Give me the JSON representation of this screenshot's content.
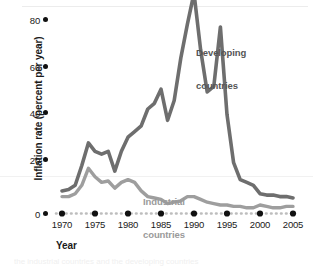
{
  "chart_data": {
    "type": "line",
    "title": "",
    "xlabel": "Year",
    "ylabel": "Inflation rate (percent per year)",
    "xlim": [
      1968,
      2006
    ],
    "ylim": [
      0,
      85
    ],
    "xticks": [
      "1970",
      "1975",
      "1980",
      "1985",
      "1990",
      "1995",
      "2000",
      "2005"
    ],
    "yticks": [
      "0",
      "20",
      "40",
      "60",
      "80"
    ],
    "grid": false,
    "legend_position": "inline-annotations",
    "series": [
      {
        "name": "Developing countries",
        "color": "#6e6e6e",
        "x": [
          1970,
          1971,
          1972,
          1973,
          1974,
          1975,
          1976,
          1977,
          1978,
          1979,
          1980,
          1981,
          1982,
          1983,
          1984,
          1985,
          1986,
          1987,
          1988,
          1989,
          1990,
          1991,
          1992,
          1993,
          1994,
          1995,
          1996,
          1997,
          1998,
          1999,
          2000,
          2001,
          2002,
          2003,
          2004,
          2005
        ],
        "values": [
          8,
          8.5,
          10,
          17,
          25,
          22,
          21,
          22,
          15,
          22,
          27,
          29,
          31,
          37,
          39,
          44,
          33,
          40,
          55,
          67,
          78,
          58,
          43,
          45,
          66,
          35,
          18,
          12,
          11,
          10,
          7,
          6.5,
          6.5,
          6,
          6,
          5.5
        ]
      },
      {
        "name": "Industrial countries",
        "color": "#9e9e9e",
        "x": [
          1970,
          1971,
          1972,
          1973,
          1974,
          1975,
          1976,
          1977,
          1978,
          1979,
          1980,
          1981,
          1982,
          1983,
          1984,
          1985,
          1986,
          1987,
          1988,
          1989,
          1990,
          1991,
          1992,
          1993,
          1994,
          1995,
          1996,
          1997,
          1998,
          1999,
          2000,
          2001,
          2002,
          2003,
          2004,
          2005
        ],
        "values": [
          6,
          6,
          7,
          10,
          16,
          13,
          11,
          11.5,
          9,
          11,
          12,
          11,
          8,
          6,
          5.5,
          5,
          3.5,
          4,
          4.5,
          6,
          6,
          5,
          4,
          3.5,
          3,
          3,
          2.5,
          2.5,
          2,
          2,
          3,
          2.5,
          2,
          2,
          2.5,
          2.5
        ]
      }
    ],
    "annotations": [
      {
        "name": "developing-countries-label",
        "text": "Developing\ncountries",
        "color": "#555555"
      },
      {
        "name": "industrial-countries-label",
        "text": "Industrial\ncountries",
        "color": "#9a9a9a"
      }
    ]
  },
  "axes": {
    "y_title": "Inflation rate (percent per year)",
    "x_title": "Year",
    "y_tick_labels": [
      "80",
      "60",
      "40",
      "20",
      "0"
    ],
    "x_tick_labels": [
      "1970",
      "1975",
      "1980",
      "1985",
      "1990",
      "1995",
      "2000",
      "2005"
    ]
  },
  "labels": {
    "developing_line1": "Developing",
    "developing_line2": "countries",
    "industrial_line1": "Industrial",
    "industrial_line2": "countries"
  },
  "caption_ghost": "the industrial countries and the developing countries"
}
